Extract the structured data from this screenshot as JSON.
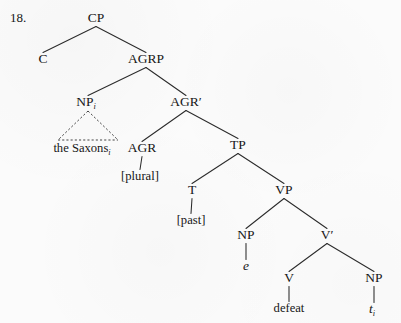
{
  "figure": {
    "example_number": "18.",
    "background_color": "#fbfbfb",
    "ink_color": "#1a1a1a",
    "width": 401,
    "height": 323
  },
  "tree": {
    "description": "X-bar phrase structure tree for 'the Saxons defeated'",
    "nodes": [
      {
        "id": "CP",
        "label": "CP",
        "sub": "",
        "italic": false,
        "x": 96,
        "y": 22
      },
      {
        "id": "C",
        "label": "C",
        "sub": "",
        "italic": false,
        "x": 43,
        "y": 63
      },
      {
        "id": "AGRP",
        "label": "AGRP",
        "sub": "",
        "italic": false,
        "x": 146,
        "y": 63
      },
      {
        "id": "NPi",
        "label": "NP",
        "sub": "i",
        "italic": false,
        "x": 88,
        "y": 106
      },
      {
        "id": "AGRbar",
        "label": "AGR′",
        "sub": "",
        "italic": false,
        "x": 186,
        "y": 106
      },
      {
        "id": "theSaxons",
        "label": "the Saxons",
        "sub": "i",
        "italic": false,
        "x": 84,
        "y": 152
      },
      {
        "id": "AGR",
        "label": "AGR",
        "sub": "",
        "italic": false,
        "x": 142,
        "y": 152
      },
      {
        "id": "TP",
        "label": "TP",
        "sub": "",
        "italic": false,
        "x": 238,
        "y": 149
      },
      {
        "id": "plural",
        "label": "[plural]",
        "sub": "",
        "italic": false,
        "x": 140,
        "y": 180
      },
      {
        "id": "T",
        "label": "T",
        "sub": "",
        "italic": false,
        "x": 192,
        "y": 194
      },
      {
        "id": "VP",
        "label": "VP",
        "sub": "",
        "italic": false,
        "x": 284,
        "y": 194
      },
      {
        "id": "past",
        "label": "[past]",
        "sub": "",
        "italic": false,
        "x": 191,
        "y": 224
      },
      {
        "id": "NPe",
        "label": "NP",
        "sub": "",
        "italic": false,
        "x": 246,
        "y": 239
      },
      {
        "id": "Vbar",
        "label": "V′",
        "sub": "",
        "italic": false,
        "x": 327,
        "y": 239
      },
      {
        "id": "e",
        "label": "e",
        "sub": "",
        "italic": true,
        "x": 246,
        "y": 270
      },
      {
        "id": "V",
        "label": "V",
        "sub": "",
        "italic": false,
        "x": 289,
        "y": 282
      },
      {
        "id": "NPt",
        "label": "NP",
        "sub": "",
        "italic": false,
        "x": 374,
        "y": 282
      },
      {
        "id": "defeat",
        "label": "defeat",
        "sub": "",
        "italic": false,
        "x": 289,
        "y": 312
      },
      {
        "id": "trace",
        "label": "t",
        "sub": "i",
        "italic": true,
        "x": 374,
        "y": 313
      }
    ],
    "edges": [
      {
        "from": "CP",
        "to": "C",
        "style": "solid"
      },
      {
        "from": "CP",
        "to": "AGRP",
        "style": "solid"
      },
      {
        "from": "AGRP",
        "to": "NPi",
        "style": "solid"
      },
      {
        "from": "AGRP",
        "to": "AGRbar",
        "style": "solid"
      },
      {
        "from": "NPi",
        "to": "theSaxons",
        "style": "triangle"
      },
      {
        "from": "AGRbar",
        "to": "AGR",
        "style": "solid"
      },
      {
        "from": "AGRbar",
        "to": "TP",
        "style": "solid"
      },
      {
        "from": "AGR",
        "to": "plural",
        "style": "solid"
      },
      {
        "from": "TP",
        "to": "T",
        "style": "solid"
      },
      {
        "from": "TP",
        "to": "VP",
        "style": "solid"
      },
      {
        "from": "T",
        "to": "past",
        "style": "solid"
      },
      {
        "from": "VP",
        "to": "NPe",
        "style": "solid"
      },
      {
        "from": "VP",
        "to": "Vbar",
        "style": "solid"
      },
      {
        "from": "NPe",
        "to": "e",
        "style": "solid"
      },
      {
        "from": "Vbar",
        "to": "V",
        "style": "solid"
      },
      {
        "from": "Vbar",
        "to": "NPt",
        "style": "solid"
      },
      {
        "from": "V",
        "to": "defeat",
        "style": "solid"
      },
      {
        "from": "NPt",
        "to": "trace",
        "style": "solid"
      }
    ],
    "triangle": {
      "apex_node": "NPi",
      "base_left_x": 58,
      "base_right_x": 118,
      "base_y": 140
    }
  }
}
